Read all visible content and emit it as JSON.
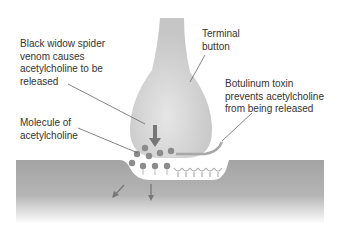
{
  "labels": {
    "black_widow": "Black widow spider\nvenom causes\nacetylcholine to be\nreleased",
    "terminal_button": "Terminal\nbutton",
    "botulinum": "Botulinum toxin\nprevents acetylcholine\nfrom being released",
    "molecule": "Molecule of\nacetylcholine"
  },
  "colors": {
    "terminal": "#d2d2d2",
    "membrane": "#a6a6a6",
    "molecule": "#8c8c8c",
    "arrow": "#777777",
    "text": "#333333"
  }
}
